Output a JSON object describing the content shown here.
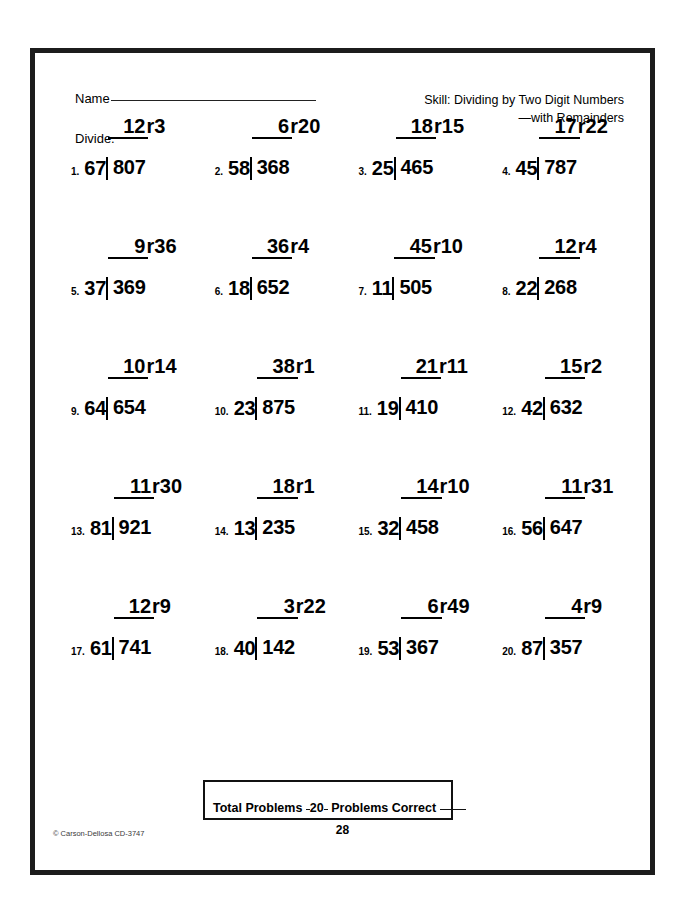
{
  "header": {
    "name_label": "Name",
    "skill_line1": "Skill:  Dividing by Two Digit Numbers",
    "skill_line2": "—with Remainders"
  },
  "instruction": "Divide.",
  "problems": [
    {
      "number": "1.",
      "divisor": "67",
      "dividend": "807",
      "quotient": "12",
      "remainder": "r3"
    },
    {
      "number": "2.",
      "divisor": "58",
      "dividend": "368",
      "quotient": "6",
      "remainder": "r20"
    },
    {
      "number": "3.",
      "divisor": "25",
      "dividend": "465",
      "quotient": "18",
      "remainder": "r15"
    },
    {
      "number": "4.",
      "divisor": "45",
      "dividend": "787",
      "quotient": "17",
      "remainder": "r22"
    },
    {
      "number": "5.",
      "divisor": "37",
      "dividend": "369",
      "quotient": "9",
      "remainder": "r36"
    },
    {
      "number": "6.",
      "divisor": "18",
      "dividend": "652",
      "quotient": "36",
      "remainder": "r4"
    },
    {
      "number": "7.",
      "divisor": "11",
      "dividend": "505",
      "quotient": "45",
      "remainder": "r10"
    },
    {
      "number": "8.",
      "divisor": "22",
      "dividend": "268",
      "quotient": "12",
      "remainder": "r4"
    },
    {
      "number": "9.",
      "divisor": "64",
      "dividend": "654",
      "quotient": "10",
      "remainder": "r14"
    },
    {
      "number": "10.",
      "divisor": "23",
      "dividend": "875",
      "quotient": "38",
      "remainder": "r1"
    },
    {
      "number": "11.",
      "divisor": "19",
      "dividend": "410",
      "quotient": "21",
      "remainder": "r11"
    },
    {
      "number": "12.",
      "divisor": "42",
      "dividend": "632",
      "quotient": "15",
      "remainder": "r2"
    },
    {
      "number": "13.",
      "divisor": "81",
      "dividend": "921",
      "quotient": "11",
      "remainder": "r30"
    },
    {
      "number": "14.",
      "divisor": "13",
      "dividend": "235",
      "quotient": "18",
      "remainder": "r1"
    },
    {
      "number": "15.",
      "divisor": "32",
      "dividend": "458",
      "quotient": "14",
      "remainder": "r10"
    },
    {
      "number": "16.",
      "divisor": "56",
      "dividend": "647",
      "quotient": "11",
      "remainder": "r31"
    },
    {
      "number": "17.",
      "divisor": "61",
      "dividend": "741",
      "quotient": "12",
      "remainder": "r9"
    },
    {
      "number": "18.",
      "divisor": "40",
      "dividend": "142",
      "quotient": "3",
      "remainder": "r22"
    },
    {
      "number": "19.",
      "divisor": "53",
      "dividend": "367",
      "quotient": "6",
      "remainder": "r49"
    },
    {
      "number": "20.",
      "divisor": "87",
      "dividend": "357",
      "quotient": "4",
      "remainder": "r9"
    }
  ],
  "footer": {
    "total_problems_label": "Total Problems",
    "total_problems_value": "20",
    "problems_correct_label": "Problems Correct",
    "problems_correct_value": "",
    "copyright": "© Carson-Dellosa CD-3747",
    "page_number": "28"
  }
}
